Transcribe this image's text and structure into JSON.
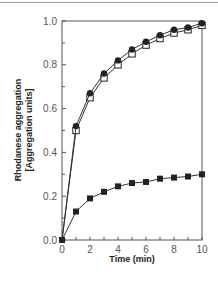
{
  "chart_data": {
    "type": "line",
    "title": "",
    "xlabel": "Time (min)",
    "ylabel_lines": [
      "Rhodanese aggregation",
      "[Aggregation units]"
    ],
    "xlim": [
      0,
      10
    ],
    "ylim": [
      0,
      1.0
    ],
    "x_ticks": [
      0,
      2,
      4,
      6,
      8,
      10
    ],
    "x_tick_labels": [
      "0",
      "2",
      "4",
      "6",
      "8",
      "10"
    ],
    "y_ticks": [
      0.0,
      0.2,
      0.4,
      0.6,
      0.8,
      1.0
    ],
    "y_tick_labels": [
      "0.0",
      "0.2",
      "0.4",
      "0.6",
      "0.8",
      "1.0"
    ],
    "grid": false,
    "legend": null,
    "x": [
      0,
      1,
      2,
      3,
      4,
      5,
      6,
      7,
      8,
      9,
      10
    ],
    "series": [
      {
        "name": "filled circles",
        "marker": "filled-circle",
        "values": [
          0.0,
          0.52,
          0.67,
          0.76,
          0.82,
          0.87,
          0.905,
          0.935,
          0.96,
          0.97,
          0.99
        ]
      },
      {
        "name": "open squares",
        "marker": "open-square",
        "values": [
          0.0,
          0.5,
          0.65,
          0.74,
          0.8,
          0.85,
          0.89,
          0.92,
          0.945,
          0.96,
          0.98
        ]
      },
      {
        "name": "filled squares",
        "marker": "filled-square",
        "values": [
          0.0,
          0.13,
          0.19,
          0.22,
          0.245,
          0.26,
          0.265,
          0.28,
          0.285,
          0.29,
          0.3
        ]
      }
    ]
  }
}
